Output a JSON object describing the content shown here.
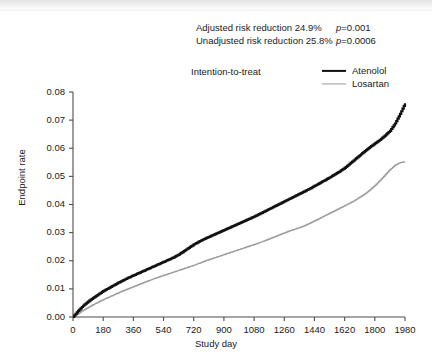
{
  "annotations": {
    "adjusted_text": "Adjusted risk reduction 24.9%",
    "adjusted_p": "p=0.001",
    "unadjusted_text": "Unadjusted risk reduction 25.8%",
    "unadjusted_p": "p=0.0006",
    "analysis_set": "Intention-to-treat"
  },
  "colors": {
    "atenolol": "#111111",
    "losartan": "#9a9a9a",
    "axis": "#4d4d4d",
    "background": "#ffffff"
  },
  "chart_data": {
    "type": "line",
    "title": "",
    "subtitle": "Intention-to-treat",
    "xlabel": "Study day",
    "ylabel": "Endpoint rate",
    "xlim": [
      0,
      1980
    ],
    "ylim": [
      0,
      0.08
    ],
    "grid": false,
    "legend_position": "top-right",
    "step": "post",
    "xticks": [
      0,
      180,
      360,
      540,
      720,
      900,
      1080,
      1260,
      1440,
      1620,
      1800,
      1980
    ],
    "yticks": [
      0.0,
      0.01,
      0.02,
      0.03,
      0.04,
      0.05,
      0.06,
      0.07,
      0.08
    ],
    "ytick_labels": [
      "0.00",
      "0.01",
      "0.02",
      "0.03",
      "0.04",
      "0.05",
      "0.06",
      "0.07",
      "0.08"
    ],
    "xtick_labels": [
      "0",
      "180",
      "360",
      "540",
      "720",
      "900",
      "1080",
      "1260",
      "1440",
      "1620",
      "1800",
      "1980"
    ],
    "x": [
      0,
      30,
      60,
      90,
      120,
      150,
      180,
      210,
      240,
      270,
      300,
      330,
      360,
      390,
      420,
      450,
      480,
      510,
      540,
      570,
      600,
      630,
      660,
      690,
      720,
      750,
      780,
      810,
      840,
      870,
      900,
      930,
      960,
      990,
      1020,
      1050,
      1080,
      1110,
      1140,
      1170,
      1200,
      1230,
      1260,
      1290,
      1320,
      1350,
      1380,
      1410,
      1440,
      1470,
      1500,
      1530,
      1560,
      1590,
      1620,
      1650,
      1680,
      1710,
      1740,
      1770,
      1800,
      1830,
      1860,
      1890,
      1920,
      1950,
      1980
    ],
    "series": [
      {
        "name": "Atenolol",
        "color": "#111111",
        "width": 2.2,
        "values": [
          0.0,
          0.0022,
          0.004,
          0.0055,
          0.0068,
          0.008,
          0.0092,
          0.0102,
          0.0112,
          0.0122,
          0.0131,
          0.014,
          0.0148,
          0.0156,
          0.0164,
          0.0172,
          0.018,
          0.0188,
          0.0196,
          0.0204,
          0.0212,
          0.0222,
          0.0234,
          0.0246,
          0.0258,
          0.0268,
          0.0277,
          0.0285,
          0.0293,
          0.0301,
          0.0309,
          0.0317,
          0.0325,
          0.0333,
          0.0341,
          0.0349,
          0.0357,
          0.0366,
          0.0375,
          0.0384,
          0.0393,
          0.0402,
          0.0411,
          0.042,
          0.0429,
          0.0438,
          0.0447,
          0.0456,
          0.0466,
          0.0476,
          0.0486,
          0.0496,
          0.0507,
          0.0518,
          0.053,
          0.0545,
          0.056,
          0.0575,
          0.059,
          0.0604,
          0.0617,
          0.063,
          0.0645,
          0.0662,
          0.0688,
          0.0722,
          0.076
        ]
      },
      {
        "name": "Losartan",
        "color": "#9a9a9a",
        "width": 1.2,
        "values": [
          0.0,
          0.0012,
          0.0024,
          0.0034,
          0.0044,
          0.0053,
          0.0062,
          0.007,
          0.0078,
          0.0086,
          0.0094,
          0.0101,
          0.0108,
          0.0115,
          0.0122,
          0.0129,
          0.0136,
          0.0142,
          0.0148,
          0.0154,
          0.016,
          0.0166,
          0.0172,
          0.0178,
          0.0184,
          0.0191,
          0.0198,
          0.0204,
          0.021,
          0.0216,
          0.0222,
          0.0228,
          0.0234,
          0.024,
          0.0246,
          0.0252,
          0.0258,
          0.0264,
          0.0271,
          0.0278,
          0.0285,
          0.0292,
          0.0299,
          0.0306,
          0.0312,
          0.0318,
          0.0325,
          0.0333,
          0.0342,
          0.0351,
          0.036,
          0.0369,
          0.0378,
          0.0387,
          0.0396,
          0.0405,
          0.0415,
          0.0426,
          0.0438,
          0.0452,
          0.0468,
          0.0486,
          0.0505,
          0.0524,
          0.054,
          0.0549,
          0.0552
        ]
      }
    ]
  }
}
